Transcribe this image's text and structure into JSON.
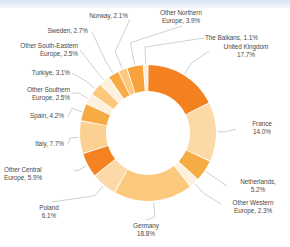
{
  "chart_data": {
    "type": "pie",
    "variant": "donut",
    "title": "",
    "subtitle": "",
    "xlabel": "",
    "ylabel": "",
    "legend": "none",
    "grid": false,
    "units": "percent",
    "start_angle_deg": 0,
    "direction": "clockwise",
    "total": 100.0,
    "categories": [
      "United Kingdom",
      "France",
      "Netherlands",
      "Other Western Europe",
      "Germany",
      "Poland",
      "Other Central Europe",
      "Italy",
      "Spain",
      "Other Southern Europe",
      "Turkiye",
      "Other South-Eastern Europe",
      "Sweden",
      "Norway",
      "Other Northern Europe",
      "The Balkans"
    ],
    "values": [
      17.7,
      14.0,
      5.2,
      2.3,
      18.8,
      6.1,
      5.9,
      7.7,
      4.2,
      2.5,
      3.1,
      2.5,
      2.7,
      2.1,
      3.9,
      1.1
    ],
    "colors": [
      "#f48120",
      "#fcd9a6",
      "#f6ab44",
      "#fdf0dc",
      "#fbc87e",
      "#fcd9a6",
      "#f58220",
      "#fbd093",
      "#f6ab44",
      "#fdf0dc",
      "#fbc87e",
      "#fdf0dc",
      "#f6ab44",
      "#fbc87e",
      "#f7a23a",
      "#fdf0dc"
    ],
    "slices": [
      {
        "label": "United Kingdom",
        "value": 17.7,
        "color": "#f48120"
      },
      {
        "label": "France",
        "value": 14.0,
        "color": "#fcd9a6"
      },
      {
        "label": "Netherlands",
        "value": 5.2,
        "color": "#f6ab44"
      },
      {
        "label": "Other Western Europe",
        "value": 2.3,
        "color": "#fdf0dc"
      },
      {
        "label": "Germany",
        "value": 18.8,
        "color": "#fbc87e"
      },
      {
        "label": "Poland",
        "value": 6.1,
        "color": "#fcd9a6"
      },
      {
        "label": "Other Central Europe",
        "value": 5.9,
        "color": "#f58220"
      },
      {
        "label": "Italy",
        "value": 7.7,
        "color": "#fbd093"
      },
      {
        "label": "Spain",
        "value": 4.2,
        "color": "#f6ab44"
      },
      {
        "label": "Other Southern Europe",
        "value": 2.5,
        "color": "#fdf0dc"
      },
      {
        "label": "Turkiye",
        "value": 3.1,
        "color": "#fbc87e"
      },
      {
        "label": "Other South-Eastern Europe",
        "value": 2.5,
        "color": "#fdf0dc"
      },
      {
        "label": "Sweden",
        "value": 2.7,
        "color": "#f6ab44"
      },
      {
        "label": "Norway",
        "value": 2.1,
        "color": "#fbc87e"
      },
      {
        "label": "Other Northern Europe",
        "value": 3.9,
        "color": "#f7a23a"
      },
      {
        "label": "The Balkans",
        "value": 1.1,
        "color": "#fdf0dc"
      }
    ]
  },
  "labels": {
    "united_kingdom": "United Kingdom\n17.7%",
    "france": "France\n14.0%",
    "netherlands": "Netherlands,\n5.2%",
    "other_western_europe": "Other Western\nEurope, 2.3%",
    "germany": "Germany\n18.8%",
    "poland": "Poland\n6.1%",
    "other_central_europe": "Other Central\nEurope, 5.9%",
    "italy": "Italy, 7.7%",
    "spain": "Spain, 4.2%",
    "other_southern_europe": "Other Southern\nEurope, 2.5%",
    "turkiye": "Turkiye, 3.1%",
    "other_south_eastern_europe": "Other South-Eastern\nEurope, 2.5%",
    "sweden": "Sweden, 2.7%",
    "norway": "Norway, 2.1%",
    "other_northern_europe": "Other Northern\nEurope, 3.9%",
    "the_balkans": "The Balkans, 1.1%"
  },
  "style": {
    "leader_line_color": "#9aa0a6",
    "text_color": "#4a4a48",
    "background": "#ffffff",
    "topbar_color": "#d9e4f2"
  }
}
